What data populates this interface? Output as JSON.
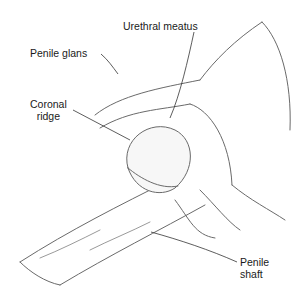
{
  "diagram": {
    "type": "anatomical illustration (line drawing)",
    "labels": [
      {
        "id": "urethral-meatus",
        "text": "Urethral meatus"
      },
      {
        "id": "penile-glans",
        "text": "Penile glans"
      },
      {
        "id": "coronal-ridge",
        "line1": "Coronal",
        "line2": "ridge"
      },
      {
        "id": "penile-shaft",
        "line1": "Penile",
        "line2": "shaft"
      }
    ],
    "colors": {
      "line": "#555555",
      "label": "#1a1a1a",
      "background": "#ffffff"
    }
  }
}
